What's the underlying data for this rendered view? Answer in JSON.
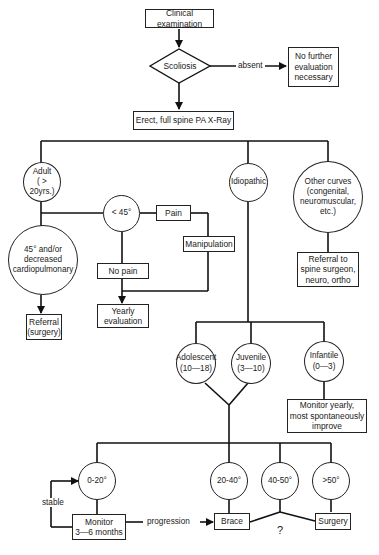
{
  "flowchart": {
    "start": "Clinical examination",
    "decision": "Scoliosis",
    "absent_label": "absent",
    "no_further": "No further\nevaluation\nnecessary",
    "xray": "Erect, full spine PA X-Ray",
    "categories": {
      "adult": "Adult\n( > 20yrs.)",
      "idiopathic": "Idiopathic",
      "other": "Other curves\n(congenital,\nneuromuscular,\netc.)"
    },
    "adult_branch": {
      "lt45": "< 45°",
      "pain": "Pain",
      "manipulation": "Manipulation",
      "no_pain": "No pain",
      "yearly": "Yearly\nevaluation",
      "severe": "45° and/or\ndecreased\ncardiopulmonary",
      "referral_surgery": "Referral\n(surgery)"
    },
    "other_branch": {
      "referral": "Referral to\nspine surgeon,\nneuro, ortho"
    },
    "idiopathic_branch": {
      "adolescent": "Adolescent\n(10—18)",
      "juvenile": "Juvenile\n(3—10)",
      "infantile": "Infantile\n(0—3)",
      "infantile_action": "Monitor yearly,\nmost spontaneously\nimprove"
    },
    "curves": {
      "c0_20": "0-20°",
      "c20_40": "20-40°",
      "c40_50": "40-50°",
      "c50": ">50°",
      "monitor": "Monitor\n3—6 months",
      "stable_label": "stable",
      "progression_label": "progression",
      "brace": "Brace",
      "surgery": "Surgery",
      "question": "?"
    }
  }
}
